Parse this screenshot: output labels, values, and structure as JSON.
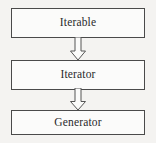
{
  "diagram": {
    "type": "flowchart",
    "orientation": "vertical-top-down",
    "title": "",
    "background_color": "#f4f3f1",
    "node_border_color": "#4a4a4a",
    "node_fill_color": "#fbfbfa",
    "text_color": "#2a2a2a",
    "arrow_style": "hollow-block-arrow",
    "arrow_outline_color": "#555555",
    "nodes": [
      {
        "id": "iterable",
        "label": "Iterable"
      },
      {
        "id": "iterator",
        "label": "Iterator"
      },
      {
        "id": "generator",
        "label": "Generator"
      }
    ],
    "edges": [
      {
        "from": "iterable",
        "to": "iterator",
        "label": ""
      },
      {
        "from": "iterator",
        "to": "generator",
        "label": ""
      }
    ]
  }
}
